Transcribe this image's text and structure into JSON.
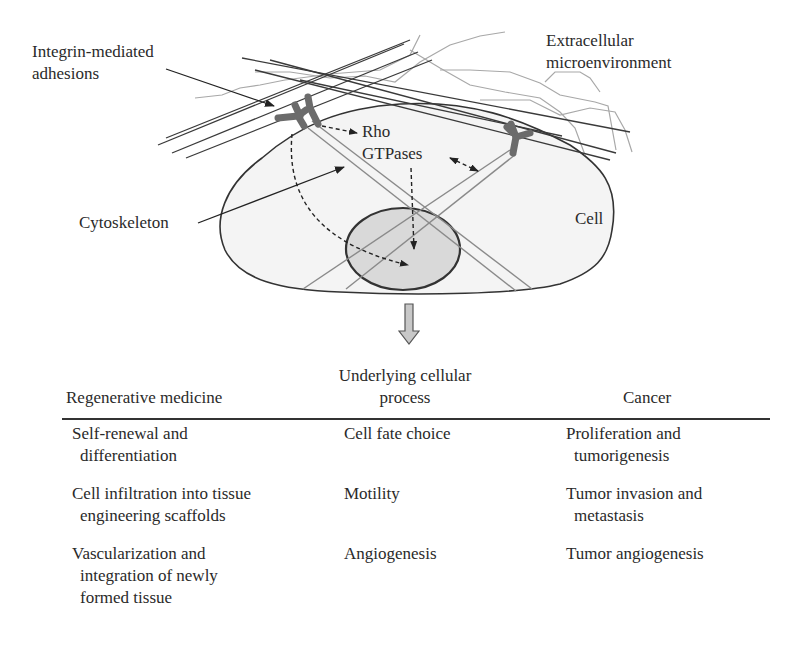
{
  "diagram": {
    "labels": {
      "integrin": [
        "Integrin-mediated",
        "adhesions"
      ],
      "extracellular": [
        "Extracellular",
        "microenvironment"
      ],
      "rho": [
        "Rho",
        "GTPases"
      ],
      "cytoskeleton": "Cytoskeleton",
      "cell": "Cell"
    },
    "colors": {
      "cell_fill": "#f4f4f4",
      "nucleus_fill": "#d9d9d9",
      "outline": "#333333",
      "fiber_dark": "#3a3a3a",
      "fiber_light": "#9a9a9a",
      "integrin": "#6b6b6b",
      "arrow_fill": "#c8c8c8"
    },
    "transition_icon": "down-arrow-icon"
  },
  "table": {
    "headers": {
      "regenerative": [
        "Regenerative medicine"
      ],
      "process": [
        "Underlying cellular",
        "process"
      ],
      "cancer": [
        "Cancer"
      ]
    },
    "rows": [
      {
        "regenerative": [
          "Self-renewal and",
          "differentiation"
        ],
        "process": [
          "Cell fate choice"
        ],
        "cancer": [
          "Proliferation and",
          "tumorigenesis"
        ]
      },
      {
        "regenerative": [
          "Cell infiltration into tissue",
          "engineering scaffolds"
        ],
        "process": [
          "Motility"
        ],
        "cancer": [
          "Tumor invasion and",
          "metastasis"
        ]
      },
      {
        "regenerative": [
          "Vascularization and",
          "integration of newly",
          "formed tissue"
        ],
        "process": [
          "Angiogenesis"
        ],
        "cancer": [
          "Tumor angiogenesis"
        ]
      }
    ]
  }
}
